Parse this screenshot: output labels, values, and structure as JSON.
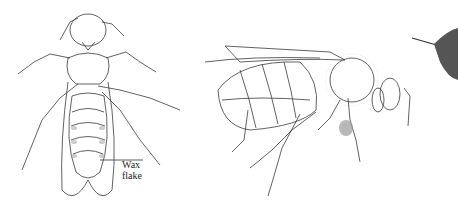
{
  "figure": {
    "panels": [
      {
        "id": "ventral-view",
        "description": "Worker honey bee, ventral view"
      },
      {
        "id": "lateral-view",
        "description": "Worker honey bee, lateral view"
      },
      {
        "id": "partial-view",
        "description": "Hairy bee, partial shaded drawing"
      }
    ],
    "labels": {
      "wax_line1": "Wax",
      "wax_line2": "flake"
    },
    "colors": {
      "line": "#3a3a3a",
      "shade": "#9a9a9a",
      "background": "#ffffff"
    }
  }
}
